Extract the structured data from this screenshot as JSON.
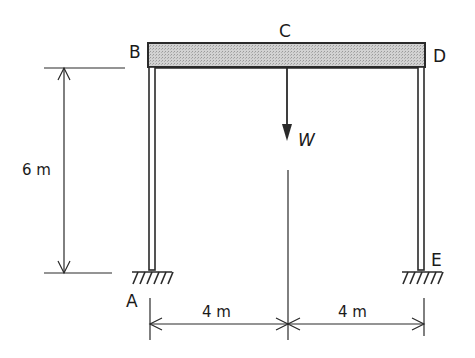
{
  "diagram": {
    "type": "portal-frame",
    "nodes": {
      "A": "A",
      "B": "B",
      "C": "C",
      "D": "D",
      "E": "E"
    },
    "load": {
      "label": "W"
    },
    "dimensions": {
      "height": "6 m",
      "left_span": "4 m",
      "right_span": "4 m"
    },
    "colors": {
      "line": "#2a2a2a",
      "beam_fill": "#c8c8c8",
      "background": "#ffffff"
    }
  }
}
